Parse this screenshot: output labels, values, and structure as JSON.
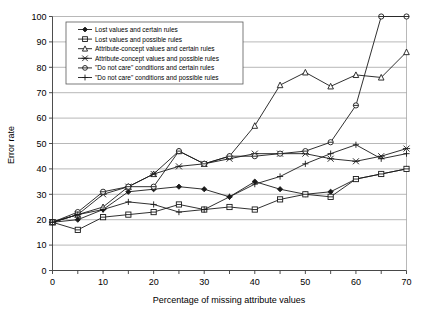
{
  "chart_data": {
    "type": "line",
    "title": "",
    "xlabel": "Percentage of missing attribute values",
    "ylabel": "Error rate",
    "xlim": [
      0,
      70
    ],
    "ylim": [
      0,
      100
    ],
    "xticks": [
      0,
      10,
      20,
      30,
      40,
      50,
      60,
      70
    ],
    "yticks": [
      0,
      10,
      20,
      30,
      40,
      50,
      60,
      70,
      80,
      90,
      100
    ],
    "grid": true,
    "legend_position": "top-left-inside",
    "x": [
      0,
      5,
      10,
      15,
      20,
      25,
      30,
      35,
      40,
      45,
      50,
      55,
      60,
      65,
      70
    ],
    "series": [
      {
        "name": "Lost values and certain rules",
        "marker": "filled-diamond",
        "values": [
          19,
          20,
          24,
          31,
          32,
          33,
          32,
          29,
          35,
          32,
          30,
          31,
          36,
          38,
          40
        ]
      },
      {
        "name": "Lost values and possible rules",
        "marker": "open-square",
        "values": [
          19,
          16,
          21,
          22,
          23,
          26,
          24,
          25,
          24,
          28,
          30,
          29,
          36,
          38,
          40
        ]
      },
      {
        "name": "Attribute-concept values and certain rules",
        "marker": "open-triangle",
        "values": [
          19,
          22,
          25,
          33,
          38,
          47,
          42,
          45,
          57,
          73,
          78,
          72.5,
          77,
          76,
          86
        ]
      },
      {
        "name": "Attribute-concept values and possible rules",
        "marker": "x-cross",
        "values": [
          19,
          22,
          30,
          33,
          38,
          41,
          42,
          44,
          46,
          46,
          46,
          44,
          43,
          45,
          48
        ]
      },
      {
        "name": "\"Do not care\" conditions and certain rules",
        "marker": "open-circle",
        "values": [
          19,
          23,
          31,
          33,
          33,
          47,
          42,
          45,
          45,
          46,
          47,
          50.5,
          65,
          100,
          100
        ]
      },
      {
        "name": "\"Do not care\" conditions and possible rules",
        "marker": "plus-cross",
        "values": [
          19,
          22,
          24,
          27,
          26,
          23,
          24,
          29,
          34,
          37,
          42,
          46,
          49.5,
          44,
          46
        ]
      }
    ]
  },
  "legend": {
    "entries": [
      "Lost values and certain rules",
      "Lost values and possible rules",
      "Attribute-concept values and certain rules",
      "Attribute-concept values and possible rules",
      "\"Do not care\" conditions and certain rules",
      "\"Do not care\" conditions and possible rules"
    ]
  },
  "axes": {
    "x_title": "Percentage of missing attribute values",
    "y_title": "Error rate",
    "x_tick_labels": [
      "0",
      "10",
      "20",
      "30",
      "40",
      "50",
      "60",
      "70"
    ],
    "y_tick_labels": [
      "0",
      "10",
      "20",
      "30",
      "40",
      "50",
      "60",
      "70",
      "80",
      "90",
      "100"
    ]
  },
  "colors": {
    "ink": "#1a1a1a",
    "grid": "#9a9a9a",
    "background": "#ffffff"
  }
}
